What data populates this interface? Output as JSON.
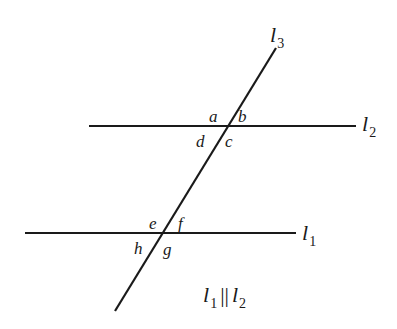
{
  "diagram": {
    "lines": [
      {
        "id": "l1",
        "name": "l",
        "subscript": "1",
        "kind": "horizontal"
      },
      {
        "id": "l2",
        "name": "l",
        "subscript": "2",
        "kind": "horizontal"
      },
      {
        "id": "l3",
        "name": "l",
        "subscript": "3",
        "kind": "transversal"
      }
    ],
    "angles_top": {
      "a": "a",
      "b": "b",
      "c": "c",
      "d": "d"
    },
    "angles_bottom": {
      "e": "e",
      "f": "f",
      "g": "g",
      "h": "h"
    },
    "relation": {
      "left": "l",
      "left_sub": "1",
      "symbol": "||",
      "right": "l",
      "right_sub": "2"
    },
    "colors": {
      "stroke": "#1a1a1a",
      "background": "#ffffff"
    }
  }
}
